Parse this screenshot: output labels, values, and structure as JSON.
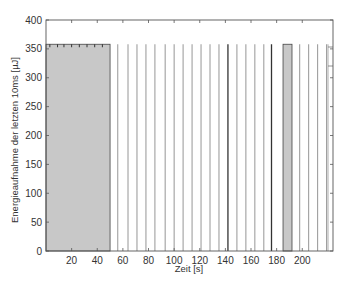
{
  "chart_data": {
    "type": "bar",
    "title": "",
    "xlabel": "Zeit [s]",
    "ylabel": "Energieaufnahme der letzten 10ms [µJ]",
    "xlim": [
      0,
      224
    ],
    "ylim": [
      0,
      400
    ],
    "xticks": [
      20,
      40,
      60,
      80,
      100,
      120,
      140,
      160,
      180,
      200
    ],
    "yticks": [
      0,
      50,
      100,
      150,
      200,
      250,
      300,
      350,
      400
    ],
    "grid": false,
    "legend": null,
    "fill_color": "#c8c8c8",
    "line_color": "#555555",
    "blocks": [
      {
        "x_start": 0,
        "x_end": 50,
        "value": 358
      },
      {
        "x_start": 185,
        "x_end": 192,
        "value": 358
      }
    ],
    "spikes": {
      "value": 358,
      "x": [
        56,
        64,
        71,
        78,
        85,
        93,
        100,
        107,
        114,
        121,
        128,
        135,
        142,
        149,
        156,
        163,
        170,
        176,
        198,
        205,
        212,
        219
      ],
      "dark_x": [
        142,
        176
      ]
    },
    "block_top_ticks": [
      3,
      9,
      14,
      20,
      26,
      32,
      38,
      44
    ]
  }
}
